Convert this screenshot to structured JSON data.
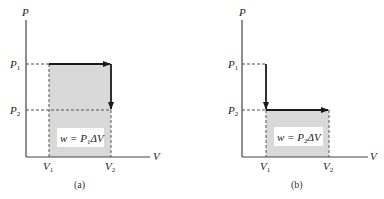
{
  "colors": {
    "axis": "#444444",
    "path": "#1a1a1a",
    "shade": "#d9d9d9",
    "dash": "#555555",
    "label_box": "#ffffff"
  },
  "panels": [
    {
      "id": "a",
      "caption": "(a)",
      "y_axis_label": "P",
      "x_axis_label": "V",
      "p1_label": "P",
      "p1_sub": "1",
      "p2_label": "P",
      "p2_sub": "2",
      "v1_label": "V",
      "v1_sub": "1",
      "v2_label": "V",
      "v2_sub": "2",
      "work_label_prefix": "w = P",
      "work_label_sub": "1",
      "work_label_suffix": "ΔV",
      "description": "Constant-pressure expansion at P1 from V1 to V2, then constant-volume pressure drop to P2; shaded work area P1ΔV"
    },
    {
      "id": "b",
      "caption": "(b)",
      "y_axis_label": "P",
      "x_axis_label": "V",
      "p1_label": "P",
      "p1_sub": "1",
      "p2_label": "P",
      "p2_sub": "2",
      "v1_label": "V",
      "v1_sub": "1",
      "v2_label": "V",
      "v2_sub": "2",
      "work_label_prefix": "w = P",
      "work_label_sub": "2",
      "work_label_suffix": "ΔV",
      "description": "Constant-volume pressure drop at V1 from P1 to P2, then constant-pressure expansion at P2 to V2; shaded work area P2ΔV"
    }
  ]
}
